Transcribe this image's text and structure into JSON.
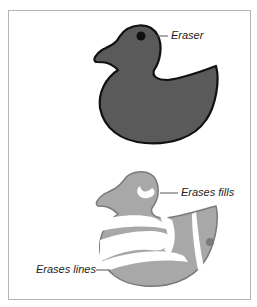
{
  "figure": {
    "callouts": {
      "eraser": "Eraser",
      "erases_fills": "Erases fills",
      "erases_lines": "Erases lines"
    },
    "colors": {
      "duck_fill_top": "#5a5a5a",
      "duck_outline": "#111111",
      "duck_fill_bottom": "#a8a8a8",
      "duck_outline_bottom": "#7a7a7a",
      "frame_border": "#b5b5b5"
    }
  }
}
